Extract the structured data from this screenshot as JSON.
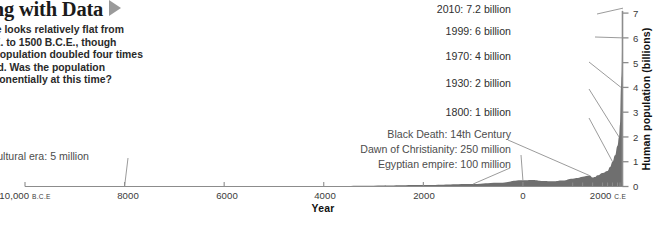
{
  "article": {
    "title": "Working with Data",
    "arrow_icon": "play-triangle-icon",
    "body_lines": [
      "This timeline looks relatively flat from",
      "10,000 B.C.E. to 1500 B.C.E., though",
      "the human population doubled four times",
      "in that period. Was the population",
      "growing exponentially at this time?"
    ]
  },
  "chart_data": {
    "type": "area",
    "title": "",
    "xlabel": "Year",
    "ylabel": "Human population (billions)",
    "xlim": [
      -10000,
      2100
    ],
    "ylim": [
      0,
      7.4
    ],
    "grid": false,
    "legend": "none",
    "x_ticks": [
      {
        "value": -10000,
        "label": "10,000",
        "era": "B.C.E"
      },
      {
        "value": -8000,
        "label": "8000",
        "era": ""
      },
      {
        "value": -6000,
        "label": "6000",
        "era": ""
      },
      {
        "value": -4000,
        "label": "4000",
        "era": ""
      },
      {
        "value": -2000,
        "label": "2000",
        "era": ""
      },
      {
        "value": 0,
        "label": "0",
        "era": ""
      },
      {
        "value": 2000,
        "label": "2000",
        "era": "C.E"
      }
    ],
    "x_minor_ticks": [
      1000,
      1200,
      1400,
      1600,
      1700,
      1800,
      1900,
      1950,
      2000
    ],
    "y_ticks": [
      {
        "value": 0,
        "label": "0"
      },
      {
        "value": 1,
        "label": "1"
      },
      {
        "value": 2,
        "label": "2"
      },
      {
        "value": 3,
        "label": "3"
      },
      {
        "value": 4,
        "label": "4"
      },
      {
        "value": 5,
        "label": "5"
      },
      {
        "value": 6,
        "label": "6"
      },
      {
        "value": 7,
        "label": "7"
      }
    ],
    "x": [
      -10000,
      -8000,
      -6000,
      -5000,
      -4000,
      -3000,
      -2000,
      -1000,
      -500,
      0,
      200,
      400,
      600,
      800,
      1000,
      1100,
      1200,
      1300,
      1340,
      1400,
      1450,
      1500,
      1600,
      1700,
      1750,
      1800,
      1850,
      1900,
      1930,
      1950,
      1970,
      1980,
      1999,
      2010
    ],
    "y": [
      0.005,
      0.006,
      0.008,
      0.012,
      0.02,
      0.035,
      0.06,
      0.1,
      0.15,
      0.25,
      0.26,
      0.22,
      0.21,
      0.24,
      0.31,
      0.34,
      0.39,
      0.43,
      0.44,
      0.36,
      0.38,
      0.45,
      0.55,
      0.63,
      0.79,
      1.0,
      1.26,
      1.65,
      2.0,
      2.5,
      4.0,
      4.45,
      6.0,
      7.2
    ],
    "annotations": [
      {
        "id": "agricultural-era",
        "text": "Agricultural era: 5 million",
        "x": -8000,
        "y": 0.005
      },
      {
        "id": "egyptian-empire",
        "text": "Egyptian empire: 100 million",
        "x": -1000,
        "y": 0.1
      },
      {
        "id": "dawn-of-christianity",
        "text": "Dawn of Christianity: 250 million",
        "x": 0,
        "y": 0.25
      },
      {
        "id": "black-death",
        "text": "Black Death: 14th Century",
        "x": 1340,
        "y": 0.44
      },
      {
        "id": "year-1800",
        "text": "1800: 1 billion",
        "x": 1800,
        "y": 1.0
      },
      {
        "id": "year-1930",
        "text": "1930: 2 billion",
        "x": 1930,
        "y": 2.0
      },
      {
        "id": "year-1970",
        "text": "1970: 4 billion",
        "x": 1970,
        "y": 4.0
      },
      {
        "id": "year-1999",
        "text": "1999: 6 billion",
        "x": 1999,
        "y": 6.0
      },
      {
        "id": "year-2010",
        "text": "2010: 7.2 billion",
        "x": 2010,
        "y": 7.2
      }
    ],
    "colors": {
      "area_fill": "#6f6f6f",
      "axis": "#8c8c8c",
      "text": "#3a3a3a",
      "annotation": "#4d4d4d",
      "accent": "#9a9a9a"
    }
  }
}
